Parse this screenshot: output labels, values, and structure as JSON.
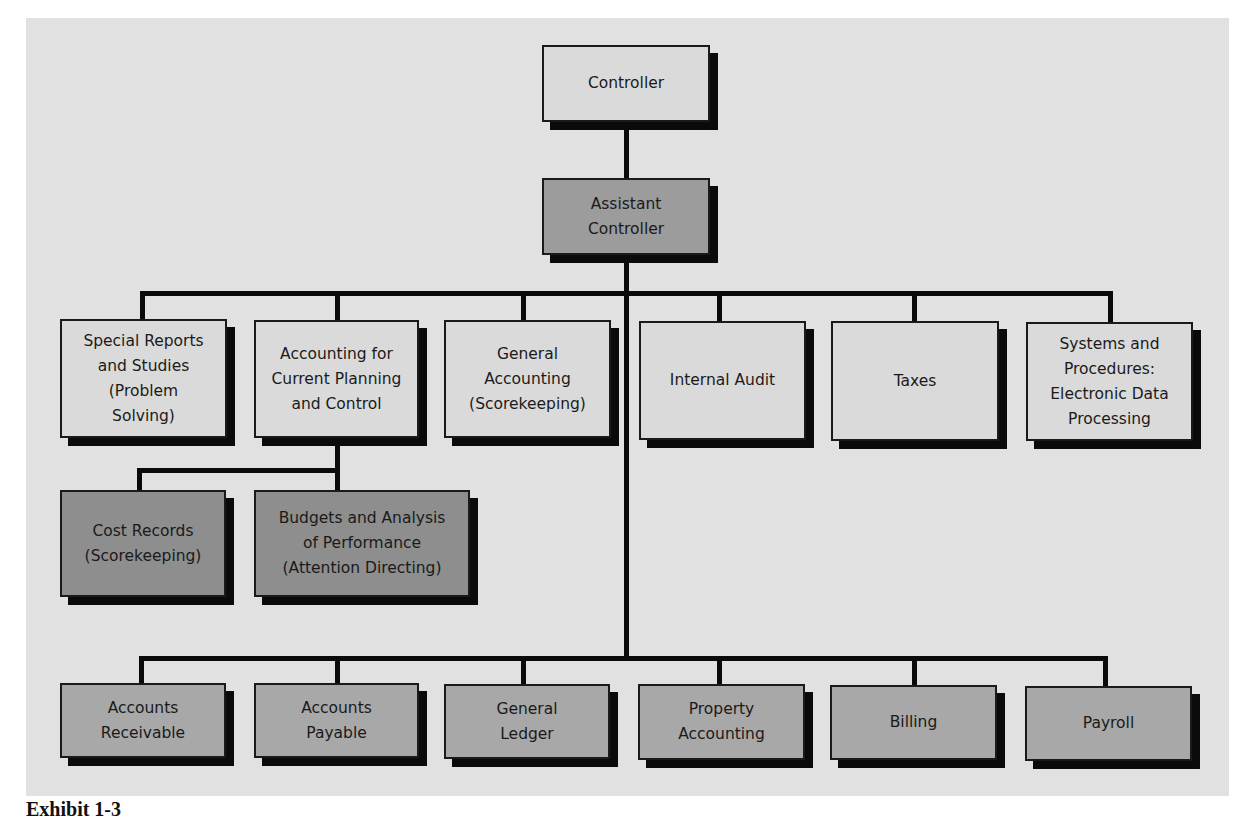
{
  "diagram": {
    "type": "organization-chart",
    "caption": "Exhibit 1-3",
    "colors": {
      "panel": "#e1e1e1",
      "light_box": "#dadada",
      "dark_box": "#939393",
      "mid_box": "#a8a8a8",
      "line": "#0a0a0a"
    },
    "nodes": {
      "controller": "Controller",
      "assistant_controller": "Assistant\nController",
      "level3": [
        "Special Reports\nand Studies\n(Problem\nSolving)",
        "Accounting for\nCurrent Planning\nand Control",
        "General\nAccounting\n(Scorekeeping)",
        "Internal Audit",
        "Taxes",
        "Systems and\nProcedures:\nElectronic Data\nProcessing"
      ],
      "planning_sub": [
        "Cost Records\n(Scorekeeping)",
        "Budgets and Analysis\nof Performance\n(Attention Directing)"
      ],
      "level4": [
        "Accounts\nReceivable",
        "Accounts\nPayable",
        "General\nLedger",
        "Property\nAccounting",
        "Billing",
        "Payroll"
      ]
    },
    "edges": [
      [
        "Controller",
        "Assistant Controller"
      ],
      [
        "Assistant Controller",
        "Special Reports and Studies (Problem Solving)"
      ],
      [
        "Assistant Controller",
        "Accounting for Current Planning and Control"
      ],
      [
        "Assistant Controller",
        "General Accounting (Scorekeeping)"
      ],
      [
        "Assistant Controller",
        "Internal Audit"
      ],
      [
        "Assistant Controller",
        "Taxes"
      ],
      [
        "Assistant Controller",
        "Systems and Procedures: Electronic Data Processing"
      ],
      [
        "Accounting for Current Planning and Control",
        "Cost Records (Scorekeeping)"
      ],
      [
        "Accounting for Current Planning and Control",
        "Budgets and Analysis of Performance (Attention Directing)"
      ],
      [
        "Assistant Controller",
        "Accounts Receivable"
      ],
      [
        "Assistant Controller",
        "Accounts Payable"
      ],
      [
        "Assistant Controller",
        "General Ledger"
      ],
      [
        "Assistant Controller",
        "Property Accounting"
      ],
      [
        "Assistant Controller",
        "Billing"
      ],
      [
        "Assistant Controller",
        "Payroll"
      ]
    ]
  }
}
